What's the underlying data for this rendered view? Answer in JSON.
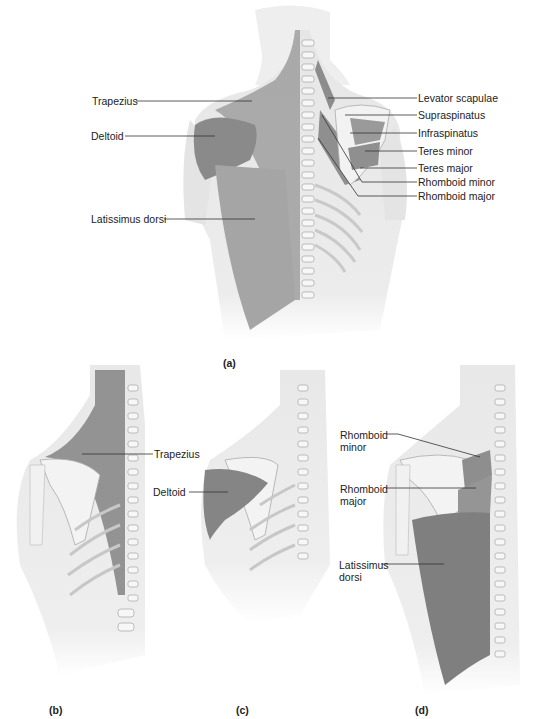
{
  "figure": {
    "panels": [
      {
        "id": "a",
        "caption": "(a)",
        "description": "Posterior view of torso showing superficial (left) and deep (right) back and shoulder muscles",
        "labels_left": [
          "Trapezius",
          "Deltoid",
          "Latissimus dorsi"
        ],
        "labels_right": [
          "Levator scapulae",
          "Supraspinatus",
          "Infraspinatus",
          "Teres minor",
          "Teres major",
          "Rhomboid minor",
          "Rhomboid major"
        ]
      },
      {
        "id": "b",
        "caption": "(b)",
        "description": "Isolated trapezius",
        "labels": [
          "Trapezius"
        ]
      },
      {
        "id": "c",
        "caption": "(c)",
        "description": "Isolated deltoid",
        "labels": [
          "Deltoid"
        ]
      },
      {
        "id": "d",
        "caption": "(d)",
        "description": "Rhomboids and latissimus dorsi",
        "labels": [
          "Rhomboid minor",
          "Rhomboid major",
          "Latissimus dorsi"
        ]
      }
    ]
  },
  "colors": {
    "skin": "#e9e9e9",
    "muscle": "#8f8f8f",
    "muscle_dark": "#6f6f6f",
    "bone": "#f4f4f4",
    "line": "#333333"
  }
}
